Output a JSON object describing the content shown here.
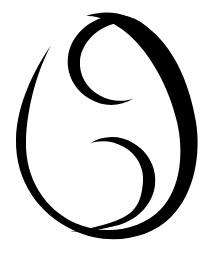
{
  "artwork": {
    "name": "cancer-zodiac-symbol",
    "title": "Cancer",
    "description": "Black brush-drawn Cancer astrological glyph: two mirrored inward spirals enclosed by a tapered oval stroke",
    "background_color": "#ffffff",
    "stroke_color": "#000000",
    "canvas": {
      "width": 211,
      "height": 256
    },
    "strokes": [
      {
        "name": "outer-oval-stroke",
        "role": "enclosing tapered oval arc",
        "start_point": [
          50,
          46
        ],
        "end_point": [
          70,
          231
        ],
        "extrema": {
          "top": 14,
          "right": 196,
          "bottom": 238,
          "left": 15
        },
        "path": "M 50.5 46 C 34 70 17 104 16 139 C 15 181 39 214 73 230 C 106 246 147 241 171 217 C 195 193 201 153 196 122 C 190 86 176 52 152 31 C 130 12 106 9 86 16 C 97 15 113 21 128 34 C 150 53 169 87 177 122 C 184 152 181 188 161 209 C 140 231 104 236 75 223 C 45 209 25 179 26 141 C 27 107 37 72 50.5 46 Z"
      },
      {
        "name": "upper-spiral-stroke",
        "role": "top inward-curling spiral (opens down-right)",
        "start_point": [
          133,
          98
        ],
        "end_point": [
          160,
          43
        ],
        "extrema": {
          "top": 14,
          "right": 160,
          "bottom": 104,
          "left": 65
        },
        "path": "M 133.5 98.5 C 120 107 103 107 90 99 C 74 90 66 73 68 57 C 70 39 84 23 104 17 C 124 11 146 19 160 43 C 147 25 127 19 110 25 C 93 31 81 46 80 61 C 79 74 86 88 99 95 C 111 102 124 102 133.5 98.5 Z"
      },
      {
        "name": "lower-spiral-stroke",
        "role": "bottom inward-curling spiral (opens up-left), mirrors upper",
        "start_point": [
          90,
          143
        ],
        "end_point": [
          70,
          231
        ],
        "extrema": {
          "top": 140,
          "right": 148,
          "bottom": 232,
          "left": 70
        },
        "path": "M 90 143.5 C 103 135 120 135 133 143 C 149 152 157 169 155 185 C 153 203 139 219 119 225 C 104 229 87 232 70 231.5 C 90 229 110 224 122 218 C 139 210 142 196 143 181 C 144 168 137 154 124 147 C 112 140 99 140 90 143.5 Z"
      }
    ]
  }
}
